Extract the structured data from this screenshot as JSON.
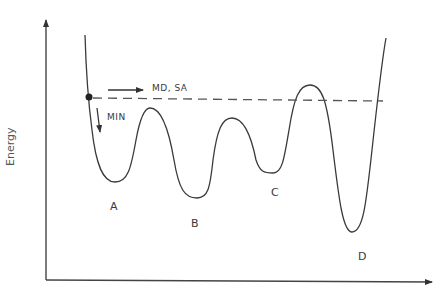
{
  "diagram": {
    "y_axis_label": "Energy",
    "x_axis_label": "",
    "minima": [
      {
        "label": "A",
        "x": 115,
        "y": 182
      },
      {
        "label": "B",
        "x": 197,
        "y": 198
      },
      {
        "label": "C",
        "x": 273,
        "y": 172
      },
      {
        "label": "D",
        "x": 352,
        "y": 232
      }
    ],
    "annotations": {
      "md_sa": "MD, SA",
      "min": "MIN"
    },
    "colors": {
      "line": "#3a3a3a",
      "dash": "#555555",
      "text": "#3a3a3a"
    }
  }
}
